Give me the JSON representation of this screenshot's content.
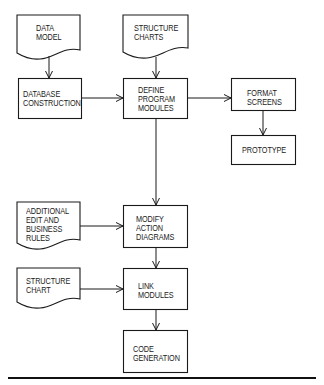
{
  "diagram": {
    "type": "flowchart",
    "colors": {
      "stroke": "#1a1a1a",
      "background": "#ffffff"
    },
    "nodes": [
      {
        "id": "data_model",
        "shape": "document",
        "lines": [
          "DATA",
          "MODEL"
        ]
      },
      {
        "id": "database_construction",
        "shape": "process",
        "lines": [
          "DATABASE",
          "CONSTRUCTION"
        ]
      },
      {
        "id": "structure_charts",
        "shape": "document",
        "lines": [
          "STRUCTURE",
          "CHARTS"
        ]
      },
      {
        "id": "define_program_modules",
        "shape": "process",
        "lines": [
          "DEFINE",
          "PROGRAM",
          "MODULES"
        ]
      },
      {
        "id": "format_screens",
        "shape": "process",
        "lines": [
          "FORMAT",
          "SCREENS"
        ]
      },
      {
        "id": "prototype",
        "shape": "process",
        "lines": [
          "PROTOTYPE"
        ]
      },
      {
        "id": "additional_rules",
        "shape": "document",
        "lines": [
          "ADDITIONAL",
          "EDIT AND",
          "BUSINESS",
          "RULES"
        ]
      },
      {
        "id": "modify_action_diagrams",
        "shape": "process",
        "lines": [
          "MODIFY",
          "ACTION",
          "DIAGRAMS"
        ]
      },
      {
        "id": "structure_chart",
        "shape": "document",
        "lines": [
          "STRUCTURE",
          "CHART"
        ]
      },
      {
        "id": "link_modules",
        "shape": "process",
        "lines": [
          "LINK",
          "MODULES"
        ]
      },
      {
        "id": "code_generation",
        "shape": "process",
        "lines": [
          "CODE",
          "GENERATION"
        ]
      }
    ],
    "edges": [
      {
        "from": "data_model",
        "to": "database_construction"
      },
      {
        "from": "structure_charts",
        "to": "define_program_modules"
      },
      {
        "from": "database_construction",
        "to": "define_program_modules"
      },
      {
        "from": "define_program_modules",
        "to": "format_screens"
      },
      {
        "from": "format_screens",
        "to": "prototype"
      },
      {
        "from": "define_program_modules",
        "to": "modify_action_diagrams"
      },
      {
        "from": "additional_rules",
        "to": "modify_action_diagrams"
      },
      {
        "from": "modify_action_diagrams",
        "to": "link_modules"
      },
      {
        "from": "structure_chart",
        "to": "link_modules"
      },
      {
        "from": "link_modules",
        "to": "code_generation"
      }
    ]
  },
  "labels": {
    "data_model": {
      "l1": "DATA",
      "l2": "MODEL"
    },
    "database_construction": {
      "l1": "DATABASE",
      "l2": "CONSTRUCTION"
    },
    "structure_charts": {
      "l1": "STRUCTURE",
      "l2": "CHARTS"
    },
    "define_program_modules": {
      "l1": "DEFINE",
      "l2": "PROGRAM",
      "l3": "MODULES"
    },
    "format_screens": {
      "l1": "FORMAT",
      "l2": "SCREENS"
    },
    "prototype": {
      "l1": "PROTOTYPE"
    },
    "additional_rules": {
      "l1": "ADDITIONAL",
      "l2": "EDIT AND",
      "l3": "BUSINESS",
      "l4": "RULES"
    },
    "modify_action_diagrams": {
      "l1": "MODIFY",
      "l2": "ACTION",
      "l3": "DIAGRAMS"
    },
    "structure_chart": {
      "l1": "STRUCTURE",
      "l2": "CHART"
    },
    "link_modules": {
      "l1": "LINK",
      "l2": "MODULES"
    },
    "code_generation": {
      "l1": "CODE",
      "l2": "GENERATION"
    }
  }
}
